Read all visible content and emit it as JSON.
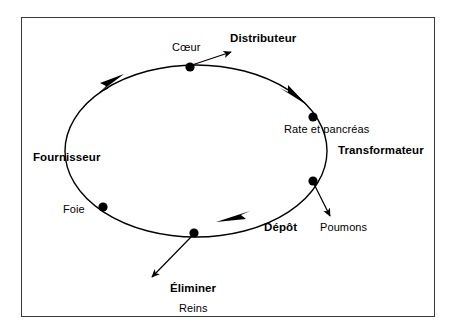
{
  "diagram": {
    "type": "cycle-diagram",
    "stroke_color": "#000000",
    "frame_color": "#3a3a3a",
    "background": "#ffffff",
    "ellipse": {
      "cx": 196,
      "cy": 151,
      "rx": 131,
      "ry": 86
    },
    "roles": {
      "distributeur": "Distributeur",
      "transformateur": "Transformateur",
      "fournisseur": "Fournisseur",
      "depot": "Dépôt",
      "eliminer": "Éliminer"
    },
    "organs": {
      "coeur": "Cœur",
      "rate_pancreas": "Rate et pancréas",
      "poumons": "Poumons",
      "foie": "Foie",
      "reins": "Reins"
    },
    "nodes": [
      {
        "id": "coeur",
        "label": "Cœur",
        "role": "Distributeur",
        "x": 190,
        "y": 67
      },
      {
        "id": "rate_pancreas",
        "label": "Rate et pancréas",
        "role": "Transformateur",
        "x": 313,
        "y": 117
      },
      {
        "id": "poumons",
        "label": "Poumons",
        "role": "Dépôt",
        "x": 313,
        "y": 181
      },
      {
        "id": "reins",
        "label": "Reins",
        "role": "Éliminer",
        "x": 194,
        "y": 233
      },
      {
        "id": "foie",
        "label": "Foie",
        "role": "Fournisseur",
        "x": 103,
        "y": 207
      }
    ],
    "flow_arrows": [
      {
        "id": "upper-left",
        "direction": "up-right"
      },
      {
        "id": "upper-right",
        "direction": "down-right"
      },
      {
        "id": "bottom",
        "direction": "left"
      }
    ],
    "branch_arrows": [
      {
        "id": "coeur-out",
        "from": "coeur",
        "to_label": "Distributeur"
      },
      {
        "id": "poumons-out",
        "from": "poumons",
        "to_label": "Poumons"
      },
      {
        "id": "reins-out",
        "from": "reins",
        "to_label": "Éliminer"
      }
    ]
  }
}
